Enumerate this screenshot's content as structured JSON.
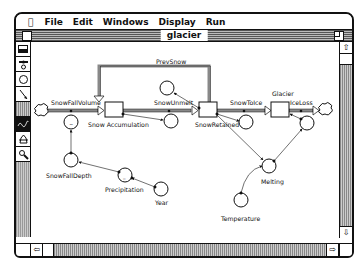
{
  "menubar": {
    "apple": "⌘",
    "items": [
      "File",
      "Edit",
      "Windows",
      "Display",
      "Run"
    ]
  },
  "window": {
    "title": "glacier"
  },
  "palette": {
    "tools": [
      {
        "name": "stock-tool-icon",
        "glyph": "▬"
      },
      {
        "name": "flow-tool-icon",
        "glyph": "❀"
      },
      {
        "name": "converter-tool-icon",
        "glyph": "○"
      },
      {
        "name": "connector-tool-icon",
        "glyph": "↘"
      },
      {
        "name": "paint-tool-icon",
        "glyph": ""
      },
      {
        "name": "dynamite-tool-icon",
        "glyph": "Dyn"
      },
      {
        "name": "ghost-tool-icon",
        "glyph": "⌂"
      },
      {
        "name": "magnifier-tool-icon",
        "glyph": "⌕"
      }
    ]
  },
  "diagram": {
    "stocks": [
      {
        "id": "snow-accumulation",
        "label": "Snow Accumulation"
      },
      {
        "id": "snow-retained",
        "label": "SnowRetained"
      },
      {
        "id": "glacier",
        "label": "Glacier"
      }
    ],
    "flows": [
      {
        "id": "snowfall-volume",
        "label": "SnowFallVolume"
      },
      {
        "id": "snow-unmelt",
        "label": "SnowUnmelt"
      },
      {
        "id": "snow-to-ice",
        "label": "SnowToIce"
      },
      {
        "id": "ice-loss",
        "label": "IceLoss"
      }
    ],
    "converters": [
      {
        "id": "prev-snow",
        "label": "PrevSnow"
      },
      {
        "id": "snowfall-depth",
        "label": "SnowFallDepth"
      },
      {
        "id": "precipitation",
        "label": "Precipitation"
      },
      {
        "id": "year",
        "label": "Year"
      },
      {
        "id": "melting",
        "label": "Melting"
      },
      {
        "id": "temperature",
        "label": "Temperature"
      }
    ]
  },
  "scrollbars": {
    "up_arrow": "⇧",
    "down_arrow": "⇩",
    "left_arrow": "⇦",
    "right_arrow": "⇨"
  }
}
